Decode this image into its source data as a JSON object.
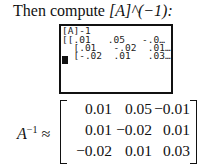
{
  "intro": {
    "prefix": "Then compute ",
    "expr": "[A]^(−1):"
  },
  "calculator_screen": {
    "lines": [
      "[A]-1",
      "[[.01   .05   -.0…",
      "  [.01   -.02  .01…",
      "  [-.02  .01   .03…"
    ]
  },
  "result": {
    "label": "A",
    "exponent": "−1",
    "approx": "≈",
    "matrix": [
      [
        "0.01",
        "0.05",
        "−0.01"
      ],
      [
        "0.01",
        "−0.02",
        "0.01"
      ],
      [
        "−0.02",
        "0.01",
        "0.03"
      ]
    ]
  }
}
